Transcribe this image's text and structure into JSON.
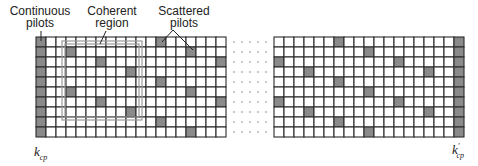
{
  "diagram": {
    "rows": 10,
    "left_block_columns": 19,
    "right_block_columns": 19,
    "ellipsis_dot_columns": 5,
    "colors": {
      "grid_line": "#2a2a2a",
      "pilot_fill": "#8a8a8a",
      "cell_fill": "#ffffff",
      "coherent_region_stroke": "#9a9a9a",
      "dot": "#888888",
      "text": "#222222"
    },
    "labels": {
      "continuous_pilots_line1": "Continuous",
      "continuous_pilots_line2": "pilots",
      "coherent_region_line1": "Coherent",
      "coherent_region_line2": "region",
      "scattered_pilots_line1": "Scattered",
      "scattered_pilots_line2": "pilots",
      "k_left_base": "k",
      "k_left_sub": "cp",
      "k_right_base": "k",
      "k_right_prime": "'",
      "k_right_sub": "cp"
    },
    "left_block": {
      "continuous_pilot_columns": [
        0
      ],
      "scattered_pilots": [
        {
          "col": 3,
          "rows": [
            1,
            5
          ]
        },
        {
          "col": 6,
          "rows": [
            2,
            6
          ]
        },
        {
          "col": 9,
          "rows": [
            3,
            7
          ]
        },
        {
          "col": 12,
          "rows": [
            0,
            4,
            8
          ]
        },
        {
          "col": 15,
          "rows": [
            1,
            5,
            9
          ]
        },
        {
          "col": 18,
          "rows": [
            2,
            6
          ]
        }
      ]
    },
    "right_block": {
      "continuous_pilot_columns": [
        18
      ],
      "scattered_pilots": [
        {
          "col": 0,
          "rows": [
            2,
            6
          ]
        },
        {
          "col": 3,
          "rows": [
            3,
            7
          ]
        },
        {
          "col": 6,
          "rows": [
            0,
            4,
            8
          ]
        },
        {
          "col": 9,
          "rows": [
            1,
            5,
            9
          ]
        },
        {
          "col": 12,
          "rows": [
            2,
            6
          ]
        },
        {
          "col": 15,
          "rows": [
            3,
            7
          ]
        }
      ]
    },
    "coherent_region": {
      "block": "left",
      "col_start": 2.6,
      "col_end": 10.6,
      "row_start": 0.4,
      "row_end": 8.3
    }
  }
}
